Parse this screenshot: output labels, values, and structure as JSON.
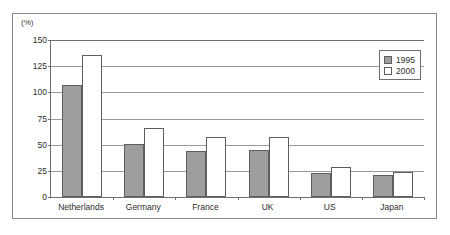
{
  "chart_data": {
    "type": "bar",
    "title": "",
    "subtitle": "",
    "xlabel": "",
    "ylabel": "(%)",
    "unit_label": "(%)",
    "categories": [
      "Netherlands",
      "Germany",
      "France",
      "UK",
      "US",
      "Japan"
    ],
    "series": [
      {
        "name": "1995",
        "color": "#9e9e9e",
        "values": [
          107,
          51,
          44,
          45,
          23,
          21
        ]
      },
      {
        "name": "2000",
        "color": "#ffffff",
        "values": [
          136,
          66,
          57,
          57,
          29,
          24
        ]
      }
    ],
    "ylim": [
      0,
      150
    ],
    "yticks": [
      0,
      25,
      50,
      75,
      100,
      125,
      150
    ],
    "ytick_labels": [
      "0",
      "25",
      "50",
      "75",
      "100",
      "125",
      "150"
    ],
    "grid": true,
    "grid_axis": "y",
    "legend_position": "top-right",
    "legend_entries": [
      "1995",
      "2000"
    ]
  },
  "colors": {
    "series_1995": "#9e9e9e",
    "series_2000": "#ffffff",
    "border": "#6e6e6e",
    "gridline": "#9a9a9a",
    "frame": "#8a8a8a",
    "text": "#2e2e2e"
  }
}
